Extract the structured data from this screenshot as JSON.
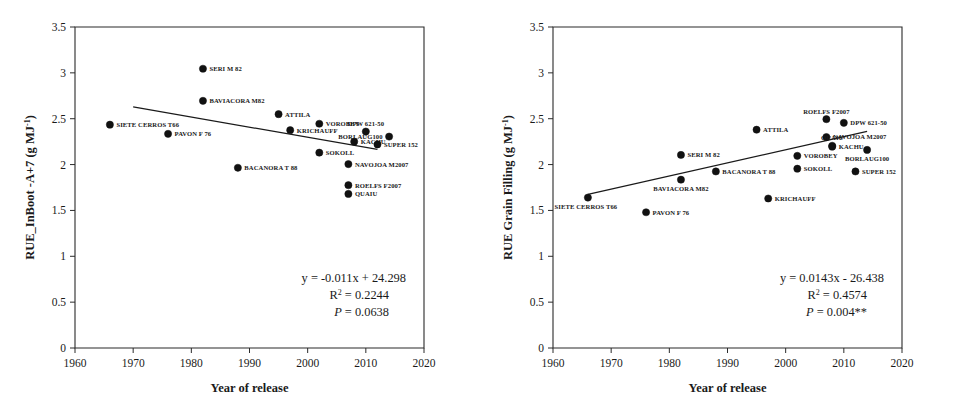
{
  "figure": {
    "panel_count": 2,
    "marker_color": "#111111",
    "line_color": "#1a1a1a",
    "frame_color": "#2b2b2b",
    "background": "#ffffff"
  },
  "chart_data": [
    {
      "type": "scatter",
      "panel": "left",
      "title": "",
      "xlabel": "Year of release",
      "ylabel": "RUE_InBoot -A+7 (g MJ⁻¹)",
      "xlim": [
        1960,
        2020
      ],
      "ylim": [
        0,
        3.5
      ],
      "xticks": [
        1960,
        1970,
        1980,
        1990,
        2000,
        2010,
        2020
      ],
      "xtick_labels": [
        "1960",
        "1970",
        "1980",
        "1990",
        "2000",
        "2010",
        "2020"
      ],
      "yticks": [
        0,
        0.5,
        1,
        1.5,
        2,
        2.5,
        3,
        3.5
      ],
      "ytick_labels": [
        "0",
        "0.5",
        "1",
        "1.5",
        "2",
        "2.5",
        "3",
        "3.5"
      ],
      "grid": false,
      "legend": "none",
      "points": [
        {
          "label": "SIETE CERROS T66",
          "x": 1966,
          "y": 2.435,
          "label_pos": "right"
        },
        {
          "label": "PAVON F 76",
          "x": 1976,
          "y": 2.335,
          "label_pos": "right"
        },
        {
          "label": "SERI M 82",
          "x": 1982,
          "y": 3.045,
          "label_pos": "right"
        },
        {
          "label": "BAVIACORA M82",
          "x": 1982,
          "y": 2.695,
          "label_pos": "right"
        },
        {
          "label": "BACANORA T 88",
          "x": 1988,
          "y": 1.965,
          "label_pos": "right"
        },
        {
          "label": "ATTILA",
          "x": 1995,
          "y": 2.55,
          "label_pos": "right"
        },
        {
          "label": "KRICHAUFF",
          "x": 1997,
          "y": 2.375,
          "label_pos": "right"
        },
        {
          "label": "VOROBEY",
          "x": 2002,
          "y": 2.445,
          "label_pos": "right"
        },
        {
          "label": "SOKOLL",
          "x": 2002,
          "y": 2.13,
          "label_pos": "right"
        },
        {
          "label": "NAVOJOA M2007",
          "x": 2007,
          "y": 2.005,
          "label_pos": "right"
        },
        {
          "label": "ROELFS F2007",
          "x": 2007,
          "y": 1.775,
          "label_pos": "right"
        },
        {
          "label": "QUAIU",
          "x": 2007,
          "y": 1.68,
          "label_pos": "right"
        },
        {
          "label": "KACHU",
          "x": 2008,
          "y": 2.25,
          "label_pos": "right"
        },
        {
          "label": "DPW 621-50",
          "x": 2010,
          "y": 2.36,
          "label_pos": "above"
        },
        {
          "label": "SUPER 152",
          "x": 2012,
          "y": 2.22,
          "label_pos": "right"
        },
        {
          "label": "BORLAUG100",
          "x": 2014,
          "y": 2.305,
          "label_pos": "left"
        }
      ],
      "trend": {
        "equation": "y = -0.011x + 24.298",
        "r2": "R² = 0.2244",
        "pvalue": "P = 0.0638",
        "slope": -0.011,
        "intercept": 24.298,
        "x_start": 1970,
        "x_end": 2012
      }
    },
    {
      "type": "scatter",
      "panel": "right",
      "title": "",
      "xlabel": "Year of release",
      "ylabel": "RUE Grain Filling (g MJ⁻¹)",
      "xlim": [
        1960,
        2020
      ],
      "ylim": [
        0,
        3.5
      ],
      "xticks": [
        1960,
        1970,
        1980,
        1990,
        2000,
        2010,
        2020
      ],
      "xtick_labels": [
        "1960",
        "1970",
        "1980",
        "1990",
        "2000",
        "2010",
        "2020"
      ],
      "yticks": [
        0,
        0.5,
        1,
        1.5,
        2,
        2.5,
        3,
        3.5
      ],
      "ytick_labels": [
        "0",
        "0.5",
        "1",
        "1.5",
        "2",
        "2.5",
        "3",
        "3.5"
      ],
      "grid": false,
      "legend": "none",
      "points": [
        {
          "label": "SIETE CERROS T66",
          "x": 1966,
          "y": 1.64,
          "label_pos": "below-left"
        },
        {
          "label": "PAVON F 76",
          "x": 1976,
          "y": 1.48,
          "label_pos": "right"
        },
        {
          "label": "SERI M 82",
          "x": 1982,
          "y": 2.105,
          "label_pos": "right"
        },
        {
          "label": "BAVIACORA M82",
          "x": 1982,
          "y": 1.835,
          "label_pos": "below"
        },
        {
          "label": "BACANORA T 88",
          "x": 1988,
          "y": 1.925,
          "label_pos": "right"
        },
        {
          "label": "ATTILA",
          "x": 1995,
          "y": 2.38,
          "label_pos": "right"
        },
        {
          "label": "KRICHAUFF",
          "x": 1997,
          "y": 1.63,
          "label_pos": "right"
        },
        {
          "label": "VOROBEY",
          "x": 2002,
          "y": 2.095,
          "label_pos": "right"
        },
        {
          "label": "SOKOLL",
          "x": 2002,
          "y": 1.955,
          "label_pos": "right"
        },
        {
          "label": "ROELFS F2007",
          "x": 2007,
          "y": 2.495,
          "label_pos": "above"
        },
        {
          "label": "NAVOJOA M2007",
          "x": 2007,
          "y": 2.3,
          "label_pos": "right"
        },
        {
          "label": "QUAIU",
          "x": 2008,
          "y": 2.205,
          "label_pos": "above"
        },
        {
          "label": "KACHU",
          "x": 2008,
          "y": 2.195,
          "label_pos": "right"
        },
        {
          "label": "DPW 621-50",
          "x": 2010,
          "y": 2.455,
          "label_pos": "right"
        },
        {
          "label": "SUPER 152",
          "x": 2012,
          "y": 1.925,
          "label_pos": "right"
        },
        {
          "label": "BORLAUG100",
          "x": 2014,
          "y": 2.16,
          "label_pos": "below"
        }
      ],
      "trend": {
        "equation": "y = 0.0143x - 26.438",
        "r2": "R² = 0.4574",
        "pvalue": "P = 0.004**",
        "slope": 0.0143,
        "intercept": -26.438,
        "x_start": 1966,
        "x_end": 2014
      }
    }
  ]
}
